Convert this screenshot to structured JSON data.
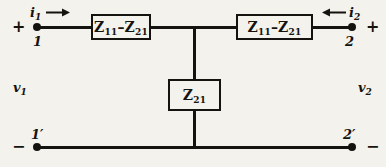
{
  "diagram": {
    "background_color": "#f4f2ec",
    "line_color": "#15130f"
  },
  "components": {
    "series_left": {
      "label_main": "Z",
      "label_sub1": "11",
      "label_dash": "–",
      "label_main2": "Z",
      "label_sub2": "21"
    },
    "series_right": {
      "label_main": "Z",
      "label_sub1": "11",
      "label_dash": "–",
      "label_main2": "Z",
      "label_sub2": "21"
    },
    "shunt": {
      "label_main": "Z",
      "label_sub1": "21"
    }
  },
  "terminals": {
    "top_left": {
      "name": "1",
      "polarity": "+"
    },
    "bottom_left": {
      "name": "1′",
      "polarity": "−"
    },
    "top_right": {
      "name": "2",
      "polarity": "+"
    },
    "bottom_right": {
      "name": "2′",
      "polarity": "−"
    }
  },
  "currents": {
    "input": {
      "symbol": "i",
      "subscript": "1",
      "direction": "right"
    },
    "output": {
      "symbol": "i",
      "subscript": "2",
      "direction": "left"
    }
  },
  "voltages": {
    "input": {
      "symbol": "v",
      "subscript": "1"
    },
    "output": {
      "symbol": "v",
      "subscript": "2"
    }
  }
}
